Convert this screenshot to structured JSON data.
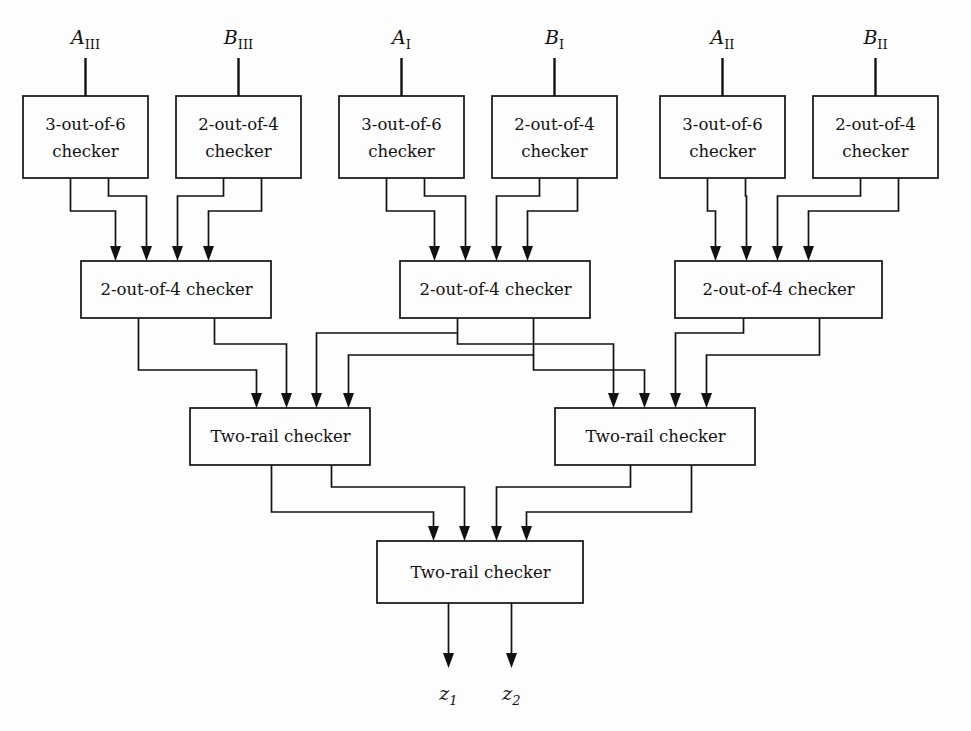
{
  "diagram": {
    "background_color": "#fdfdfd",
    "line_color": "#111111",
    "inputs": [
      {
        "id": "A_III",
        "base": "A",
        "sub": "III",
        "x": 85,
        "label": "A"
      },
      {
        "id": "B_III",
        "base": "B",
        "sub": "III",
        "x": 238,
        "label": "B"
      },
      {
        "id": "A_I",
        "base": "A",
        "sub": "I",
        "x": 401,
        "label": "A"
      },
      {
        "id": "B_I",
        "base": "B",
        "sub": "I",
        "x": 554,
        "label": "B"
      },
      {
        "id": "A_II",
        "base": "A",
        "sub": "II",
        "x": 722,
        "label": "A"
      },
      {
        "id": "B_II",
        "base": "B",
        "sub": "II",
        "x": 875,
        "label": "B"
      }
    ],
    "outputs": [
      {
        "id": "z_1",
        "base": "z",
        "sub": "1",
        "x": 448
      },
      {
        "id": "z_2",
        "base": "z",
        "sub": "2",
        "x": 511
      }
    ],
    "row1_boxes": [
      {
        "id": "r1b1",
        "line1": "3-out-of-6",
        "line2": "checker",
        "x": 23,
        "y": 96,
        "w": 125,
        "h": 82
      },
      {
        "id": "r1b2",
        "line1": "2-out-of-4",
        "line2": "checker",
        "x": 176,
        "y": 96,
        "w": 125,
        "h": 82
      },
      {
        "id": "r1b3",
        "line1": "3-out-of-6",
        "line2": "checker",
        "x": 339,
        "y": 96,
        "w": 125,
        "h": 82
      },
      {
        "id": "r1b4",
        "line1": "2-out-of-4",
        "line2": "checker",
        "x": 492,
        "y": 96,
        "w": 125,
        "h": 82
      },
      {
        "id": "r1b5",
        "line1": "3-out-of-6",
        "line2": "checker",
        "x": 660,
        "y": 96,
        "w": 125,
        "h": 82
      },
      {
        "id": "r1b6",
        "line1": "2-out-of-4",
        "line2": "checker",
        "x": 813,
        "y": 96,
        "w": 125,
        "h": 82
      }
    ],
    "row2_boxes": [
      {
        "id": "r2b1",
        "label": "2-out-of-4 checker",
        "x": 81,
        "y": 261,
        "w": 190,
        "h": 57
      },
      {
        "id": "r2b2",
        "label": "2-out-of-4 checker",
        "x": 400,
        "y": 261,
        "w": 190,
        "h": 57
      },
      {
        "id": "r2b3",
        "label": "2-out-of-4 checker",
        "x": 675,
        "y": 261,
        "w": 207,
        "h": 57
      }
    ],
    "row3_boxes": [
      {
        "id": "r3b1",
        "label": "Two-rail checker",
        "x": 190,
        "y": 408,
        "w": 180,
        "h": 57
      },
      {
        "id": "r3b2",
        "label": "Two-rail checker",
        "x": 555,
        "y": 408,
        "w": 200,
        "h": 57
      }
    ],
    "row4_boxes": [
      {
        "id": "r4b1",
        "label": "Two-rail checker",
        "x": 377,
        "y": 541,
        "w": 206,
        "h": 62
      }
    ]
  }
}
